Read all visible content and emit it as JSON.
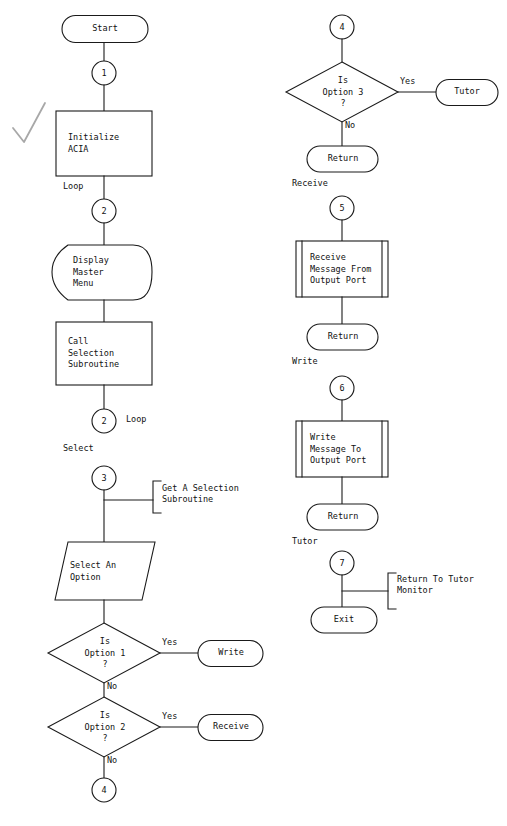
{
  "diagram": {
    "stroke_color": "#1a1a1a",
    "fill_color": "#ffffff",
    "mark_color": "#9a9a9a"
  },
  "nodes": {
    "start": {
      "label": "Start"
    },
    "conn1": {
      "label": "1"
    },
    "init_acia": {
      "label": "Initialize\nACIA"
    },
    "loop1": {
      "label": "Loop"
    },
    "conn2a": {
      "label": "2"
    },
    "display_menu": {
      "label": "Display\nMaster\nMenu"
    },
    "call_selection": {
      "label": "Call\nSelection\nSubroutine"
    },
    "conn2b": {
      "label": "2"
    },
    "loop2": {
      "label": "Loop"
    },
    "select_caption": {
      "label": "Select"
    },
    "conn3": {
      "label": "3"
    },
    "annotation_select": {
      "label": "Get A Selection\nSubroutine"
    },
    "select_option": {
      "label": "Select An\nOption"
    },
    "decision_opt1": {
      "label": "Is\nOption 1\n?"
    },
    "yes1": {
      "label": "Yes"
    },
    "no1": {
      "label": "No"
    },
    "write_term": {
      "label": "Write"
    },
    "decision_opt2": {
      "label": "Is\nOption 2\n?"
    },
    "yes2": {
      "label": "Yes"
    },
    "no2": {
      "label": "No"
    },
    "receive_term": {
      "label": "Receive"
    },
    "conn4_bottom": {
      "label": "4"
    },
    "conn4_top": {
      "label": "4"
    },
    "decision_opt3": {
      "label": "Is\nOption 3\n?"
    },
    "yes3": {
      "label": "Yes"
    },
    "no3": {
      "label": "No"
    },
    "tutor_term": {
      "label": "Tutor"
    },
    "return1": {
      "label": "Return"
    },
    "receive_caption": {
      "label": "Receive"
    },
    "conn5": {
      "label": "5"
    },
    "receive_msg": {
      "label": "Receive\nMessage From\nOutput Port"
    },
    "return2": {
      "label": "Return"
    },
    "write_caption": {
      "label": "Write"
    },
    "conn6": {
      "label": "6"
    },
    "write_msg": {
      "label": "Write\nMessage To\nOutput Port"
    },
    "return3": {
      "label": "Return"
    },
    "tutor_caption": {
      "label": "Tutor"
    },
    "conn7": {
      "label": "7"
    },
    "annotation_tutor": {
      "label": "Return To Tutor\nMonitor"
    },
    "exit_term": {
      "label": "Exit"
    }
  }
}
